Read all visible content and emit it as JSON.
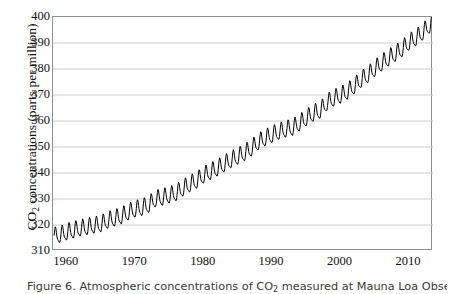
{
  "figure": {
    "caption_prefix": "Figure 6.",
    "caption_text": "Figure 6. Atmospheric concentrations of CO2 measured at Mauna Loa Observatory",
    "caption_part1": "Figure 6. Atmospheric concentrations of CO",
    "caption_sub": "2",
    "caption_part2": " measured at Mauna Loa Observatory"
  },
  "chart_data": {
    "type": "line",
    "title": "",
    "xlabel": "",
    "ylabel_part1": "CO",
    "ylabel_sub": "2",
    "ylabel_part2": " concentrations (parts per million)",
    "ylabel": "CO2 concentrations (parts per million)",
    "xlim": [
      1958,
      2013.5
    ],
    "ylim": [
      310,
      400
    ],
    "yticks": [
      310,
      320,
      330,
      340,
      350,
      360,
      370,
      380,
      390,
      400
    ],
    "xticks": [
      1960,
      1970,
      1980,
      1990,
      2000,
      2010
    ],
    "x_minor_tick_interval": 1,
    "grid": "horizontal",
    "grid_color": "#cccccc",
    "line_color": "#000000",
    "legend": "none",
    "series": [
      {
        "name": "Mauna Loa monthly mean CO2",
        "annual_mean_x": [
          1958,
          1959,
          1960,
          1961,
          1962,
          1963,
          1964,
          1965,
          1966,
          1967,
          1968,
          1969,
          1970,
          1971,
          1972,
          1973,
          1974,
          1975,
          1976,
          1977,
          1978,
          1979,
          1980,
          1981,
          1982,
          1983,
          1984,
          1985,
          1986,
          1987,
          1988,
          1989,
          1990,
          1991,
          1992,
          1993,
          1994,
          1995,
          1996,
          1997,
          1998,
          1999,
          2000,
          2001,
          2002,
          2003,
          2004,
          2005,
          2006,
          2007,
          2008,
          2009,
          2010,
          2011,
          2012,
          2013
        ],
        "annual_mean_y": [
          315.3,
          315.9,
          316.9,
          317.6,
          318.4,
          318.9,
          319.5,
          320.0,
          321.4,
          322.2,
          323.1,
          324.6,
          325.7,
          326.3,
          327.5,
          329.7,
          330.2,
          331.1,
          332.0,
          333.8,
          335.4,
          336.8,
          338.8,
          340.1,
          341.5,
          343.1,
          344.7,
          346.0,
          347.4,
          349.2,
          351.6,
          353.1,
          354.4,
          355.6,
          356.4,
          357.1,
          358.8,
          360.8,
          362.6,
          363.7,
          366.7,
          368.4,
          369.5,
          371.0,
          373.1,
          375.6,
          377.4,
          379.8,
          381.9,
          383.8,
          385.6,
          387.4,
          389.9,
          391.6,
          393.8,
          396.5
        ],
        "seasonal_amplitude_ppm": 6.0,
        "seasonal_peak_month": "May",
        "seasonal_trough_month": "September",
        "n_points_per_year": 12,
        "start_year": 1958,
        "end_year": 2013,
        "start_value": 315.3,
        "end_value": 396.5,
        "min_value": 312.9,
        "max_value": 399.8
      }
    ]
  }
}
